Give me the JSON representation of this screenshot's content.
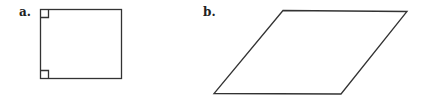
{
  "figures": [
    {
      "label": "a.",
      "shape": "square",
      "annotations": [
        "right-angle-marker-top-left",
        "right-angle-marker-bottom-left"
      ]
    },
    {
      "label": "b.",
      "shape": "parallelogram",
      "annotations": []
    }
  ],
  "colors": {
    "stroke": "#333333",
    "background": "#ffffff"
  }
}
